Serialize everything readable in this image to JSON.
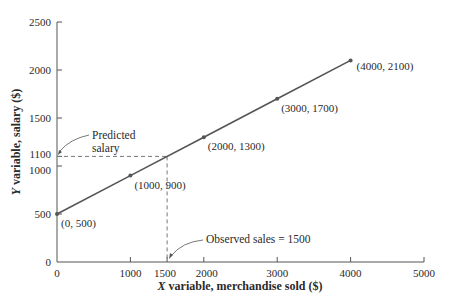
{
  "chart_data": {
    "type": "line",
    "title": "",
    "xlabel": "X variable, merchandise sold ($)",
    "ylabel": "Y variable, salary ($)",
    "xlim": [
      0,
      5000
    ],
    "ylim": [
      0,
      2500
    ],
    "grid": false,
    "x_ticks": [
      0,
      1000,
      1500,
      2000,
      3000,
      4000,
      5000
    ],
    "y_ticks": [
      0,
      500,
      1000,
      1100,
      1500,
      2000,
      2500
    ],
    "series": [
      {
        "name": "Salary line",
        "x": [
          0,
          1000,
          2000,
          3000,
          4000
        ],
        "y": [
          500,
          900,
          1300,
          1700,
          2100
        ],
        "labels": [
          "(0, 500)",
          "(1000, 900)",
          "(2000, 1300)",
          "(3000, 1700)",
          "(4000, 2100)"
        ]
      }
    ],
    "annotations": [
      {
        "text_line1": "Predicted",
        "text_line2": "salary",
        "points_to": [
          0,
          1100
        ]
      },
      {
        "text": "Observed sales = 1500",
        "points_to": [
          1500,
          0
        ]
      }
    ],
    "guides": {
      "x": 1500,
      "y": 1100,
      "style": "dashed"
    }
  },
  "colors": {
    "line": "#555555",
    "axis": "#555555",
    "text": "#2a2a2a"
  }
}
